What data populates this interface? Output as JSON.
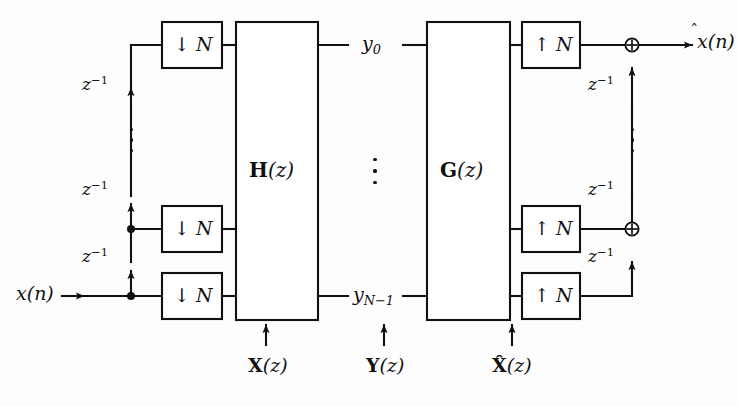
{
  "diagram": {
    "stroke_color": "#111111",
    "background": "#fdfdfd"
  },
  "signals": {
    "input": "x(n)",
    "output_base": "x",
    "output_hat": "̂",
    "output_arg": "(n)",
    "subband_top": "y",
    "subband_top_index": "0",
    "subband_bottom": "y",
    "subband_bottom_index": "N−1"
  },
  "delay_label": {
    "base": "z",
    "exponent": "−1"
  },
  "analysis": {
    "decimator_symbol": "↓",
    "decimator_factor": "N",
    "block_name": "H",
    "block_arg": "(z)",
    "vector_label_bold": "X",
    "vector_label_arg": "(z)",
    "delays": [
      "z⁻¹",
      "z⁻¹",
      "z⁻¹"
    ]
  },
  "midband": {
    "vector_label_bold": "Y",
    "vector_label_arg": "(z)"
  },
  "synthesis": {
    "interpolator_symbol": "↑",
    "interpolator_factor": "N",
    "block_name": "G",
    "block_arg": "(z)",
    "vector_label_bold": "X̂",
    "vector_label_arg": "(z)",
    "delays": [
      "z⁻¹",
      "z⁻¹",
      "z⁻¹"
    ],
    "adder_symbol": "⊕"
  },
  "geometry": {
    "row_top_y": 45,
    "row_mid_y": 229,
    "row_bottom_y": 296,
    "analysis_bus_x": 131,
    "synthesis_bus_x": 632,
    "h_block": {
      "x": 236,
      "y": 22,
      "w": 82,
      "h": 298
    },
    "g_block": {
      "x": 427,
      "y": 22,
      "w": 83,
      "h": 298
    }
  }
}
